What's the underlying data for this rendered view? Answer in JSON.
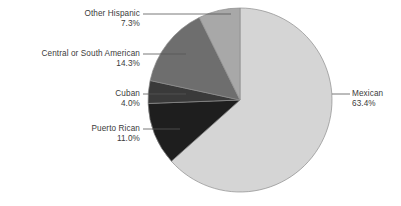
{
  "chart_data": {
    "type": "pie",
    "title": "",
    "subtitle": "",
    "xlabel": "",
    "ylabel": "",
    "legend_position": "callout-labels",
    "grid": false,
    "total_percent": 100.0,
    "start_angle_deg": 0,
    "direction": "clockwise",
    "categories": [
      "Mexican",
      "Puerto Rican",
      "Cuban",
      "Central or South American",
      "Other Hispanic"
    ],
    "values": [
      63.4,
      11.0,
      4.0,
      14.3,
      7.3
    ],
    "value_labels": [
      "63.4%",
      "11.0%",
      "4.0%",
      "14.3%",
      "7.3%"
    ],
    "colors": [
      "#d5d5d5",
      "#1e1e1e",
      "#3a3a3a",
      "#6e6e6e",
      "#a8a8a8"
    ],
    "slices": [
      {
        "name": "Mexican",
        "value": 63.4,
        "value_label": "63.4%",
        "color": "#d5d5d5"
      },
      {
        "name": "Puerto Rican",
        "value": 11.0,
        "value_label": "11.0%",
        "color": "#1e1e1e"
      },
      {
        "name": "Cuban",
        "value": 4.0,
        "value_label": "4.0%",
        "color": "#3a3a3a"
      },
      {
        "name": "Central or South American",
        "value": 14.3,
        "value_label": "14.3%",
        "color": "#6e6e6e"
      },
      {
        "name": "Other Hispanic",
        "value": 7.3,
        "value_label": "7.3%",
        "color": "#a8a8a8"
      }
    ]
  },
  "callouts": {
    "mexican": {
      "name": "Mexican",
      "value": "63.4%"
    },
    "puerto_rican": {
      "name": "Puerto Rican",
      "value": "11.0%"
    },
    "cuban": {
      "name": "Cuban",
      "value": "4.0%"
    },
    "central_south": {
      "name": "Central or South American",
      "value": "14.3%"
    },
    "other_hispanic": {
      "name": "Other Hispanic",
      "value": "7.3%"
    }
  },
  "style": {
    "background": "#ffffff",
    "text_color": "#3b3b3b",
    "leader_line_color": "#555555",
    "slice_outline_color": "#8c8c8c"
  }
}
